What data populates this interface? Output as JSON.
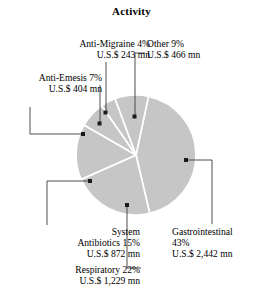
{
  "chart_data": {
    "type": "pie",
    "title": "Activity",
    "xlabel": "",
    "ylabel": "",
    "legend_position": "none",
    "grid": false,
    "unit_label": "U.S.$ mn",
    "slice_fill": "#c6c6c6",
    "divider_color": "#ffffff",
    "leader_color": "#3a3a3a",
    "categories": [
      "Gastrointestinal",
      "Respiratory",
      "System Antibiotics",
      "Anti-Emesis",
      "Anti-Migraine",
      "Other"
    ],
    "values": [
      43,
      22,
      15,
      7,
      4,
      9
    ],
    "amounts": [
      2442,
      1229,
      872,
      404,
      243,
      466
    ],
    "slices": [
      {
        "name": "Gastrointestinal",
        "percent_text": "43%",
        "value_text": "U.S.$ 2,442 mn",
        "percent": 43,
        "amount": 2442,
        "label_lines": [
          "Gastrointestinal",
          "43%",
          "U.S.$ 2,442 mn"
        ],
        "align": "left"
      },
      {
        "name": "Respiratory",
        "percent_text": "22%",
        "value_text": "U.S.$ 1,229 mn",
        "percent": 22,
        "amount": 1229,
        "label_lines": [
          "Respiratory  22%",
          "U.S.$ 1,229 mn"
        ],
        "align": "right"
      },
      {
        "name": "System Antibiotics",
        "percent_text": "15%",
        "value_text": "U.S.$ 872 mn",
        "percent": 15,
        "amount": 872,
        "label_lines": [
          "System",
          "Antibiotics  15%",
          "U.S.$ 872 mn"
        ],
        "align": "right"
      },
      {
        "name": "Anti-Emesis",
        "percent_text": "7%",
        "value_text": "U.S.$ 404 mn",
        "percent": 7,
        "amount": 404,
        "label_lines": [
          "Anti-Emesis  7%",
          "U.S.$ 404 mn"
        ],
        "align": "right"
      },
      {
        "name": "Anti-Migraine",
        "percent_text": "4%",
        "value_text": "U.S.$ 243 mn",
        "percent": 4,
        "amount": 243,
        "label_lines": [
          "Anti-Migraine  4%",
          "U.S.$ 243 mn"
        ],
        "align": "right"
      },
      {
        "name": "Other",
        "percent_text": "9%",
        "value_text": "U.S.$ 466 mn",
        "percent": 9,
        "amount": 466,
        "label_lines": [
          "Other  9%",
          "U.S.$ 466 mn"
        ],
        "align": "left"
      }
    ]
  },
  "labels": {
    "title": "Activity",
    "anti_migraine": {
      "line1": "Anti-Migraine  4%",
      "line2": "U.S.$ 243 mn"
    },
    "anti_emesis": {
      "line1": "Anti-Emesis  7%",
      "line2": "U.S.$ 404 mn"
    },
    "other": {
      "line1": "Other  9%",
      "line2": "U.S.$ 466 mn"
    },
    "gastrointestinal": {
      "line1": "Gastrointestinal",
      "line2": "43%",
      "line3": "U.S.$ 2,442 mn"
    },
    "respiratory": {
      "line1": "Respiratory  22%",
      "line2": "U.S.$ 1,229 mn"
    },
    "antibiotics": {
      "line1": "System",
      "line2": "Antibiotics  15%",
      "line3": "U.S.$ 872 mn"
    }
  }
}
